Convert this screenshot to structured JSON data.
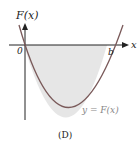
{
  "diagram": {
    "y_axis_label": "F(x)",
    "x_axis_label": "x",
    "origin_label": "0",
    "root_label": "b",
    "curve_label": "y = F(x)",
    "caption": "(D)",
    "colors": {
      "axis": "#222222",
      "curve": "#7a5a5a",
      "shade": "#e6e6e6",
      "curve_label": "#888888"
    }
  }
}
